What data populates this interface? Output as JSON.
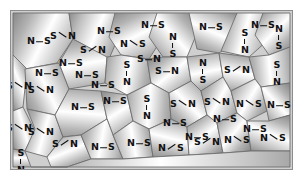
{
  "figure": {
    "kind": "microstructure-schematic",
    "border_color": "#8d8d8d",
    "background_color": "#cfcfcf",
    "grain_fill_light": "#ffffff",
    "grain_fill_dark": "#8a8a8a",
    "grain_edge_color": "#6e6e6e",
    "label_color": "#111111",
    "atom_labels": [
      "N",
      "S"
    ],
    "grain_count": 44,
    "label_count": 44
  },
  "grains": [
    {
      "id": 1,
      "points": "2,2 58,2 62,28 46,52 14,58 2,44",
      "angle": 25
    },
    {
      "id": 2,
      "points": "58,2 104,2 110,20 98,48 62,28",
      "angle": 200
    },
    {
      "id": 3,
      "points": "104,2 146,2 152,26 138,48 110,44 98,26",
      "angle": 60
    },
    {
      "id": 4,
      "points": "146,2 178,2 186,22 176,46 152,46 138,26",
      "angle": 140
    },
    {
      "id": 5,
      "points": "178,2 226,2 230,26 208,42 186,38",
      "angle": 300
    },
    {
      "id": 6,
      "points": "226,2 252,2 256,30 238,46 210,40",
      "angle": 15
    },
    {
      "id": 7,
      "points": "252,2 279,2 279,36 258,44 244,24",
      "angle": 230
    },
    {
      "id": 8,
      "points": "2,44 16,58 12,96 2,100",
      "angle": 120
    },
    {
      "id": 9,
      "points": "14,58 48,52 58,78 44,104 16,98",
      "angle": 330
    },
    {
      "id": 10,
      "points": "48,52 62,28 96,46 94,72 58,78",
      "angle": 80
    },
    {
      "id": 11,
      "points": "96,46 110,44 136,48 140,72 116,84 94,72",
      "angle": 190
    },
    {
      "id": 12,
      "points": "136,48 152,46 176,46 180,70 158,82 140,72",
      "angle": 45
    },
    {
      "id": 13,
      "points": "176,46 208,42 212,66 190,80 180,70",
      "angle": 260
    },
    {
      "id": 14,
      "points": "208,42 238,46 244,68 220,80 212,66",
      "angle": 100
    },
    {
      "id": 15,
      "points": "238,46 258,44 279,36 279,72 250,76 244,68",
      "angle": 355
    },
    {
      "id": 16,
      "points": "2,100 12,96 24,120 14,140 2,138",
      "angle": 150
    },
    {
      "id": 17,
      "points": "16,98 44,104 52,126 36,146 14,140 24,118",
      "angle": 20
    },
    {
      "id": 18,
      "points": "44,104 58,78 90,80 96,108 70,124 52,126",
      "angle": 275
    },
    {
      "id": 19,
      "points": "90,80 116,84 122,110 102,124 96,108",
      "angle": 65
    },
    {
      "id": 20,
      "points": "116,84 140,72 158,82 160,108 138,118 122,110",
      "angle": 185
    },
    {
      "id": 21,
      "points": "158,82 180,70 190,80 196,104 176,116 160,108",
      "angle": 310
    },
    {
      "id": 22,
      "points": "190,80 212,66 220,80 226,102 206,112 196,104",
      "angle": 35
    },
    {
      "id": 23,
      "points": "220,80 244,68 250,76 256,100 236,110 226,102",
      "angle": 215
    },
    {
      "id": 24,
      "points": "250,76 279,72 279,104 258,110 256,100",
      "angle": 130
    },
    {
      "id": 25,
      "points": "2,138 14,140 20,156 2,156",
      "angle": 90
    },
    {
      "id": 26,
      "points": "36,146 52,126 70,124 80,148 56,156 40,156",
      "angle": 240
    },
    {
      "id": 27,
      "points": "70,124 96,108 102,124 112,148 80,148",
      "angle": 10
    },
    {
      "id": 28,
      "points": "102,124 122,110 138,118 142,146 112,148",
      "angle": 170
    },
    {
      "id": 29,
      "points": "138,118 160,108 176,116 178,144 142,146",
      "angle": 285
    },
    {
      "id": 30,
      "points": "176,116 196,104 206,112 212,142 178,144",
      "angle": 55
    },
    {
      "id": 31,
      "points": "206,112 226,102 236,110 240,140 212,142",
      "angle": 225
    },
    {
      "id": 32,
      "points": "236,110 258,110 279,104 279,140 240,140",
      "angle": 115
    },
    {
      "id": 33,
      "points": "20,156 40,156 56,156 80,148 112,148 142,146 178,144 212,142 240,140 279,140 279,156",
      "angle": 0
    }
  ],
  "labels": [
    {
      "id": 1,
      "x": 28,
      "y": 30,
      "form": "h",
      "a": "N",
      "b": "S"
    },
    {
      "id": 2,
      "x": 82,
      "y": 38,
      "form": "dne",
      "a": "S",
      "b": "N"
    },
    {
      "id": 3,
      "x": 122,
      "y": 32,
      "form": "dsw",
      "a": "N",
      "b": "S"
    },
    {
      "id": 4,
      "x": 162,
      "y": 34,
      "form": "v",
      "a": "N",
      "b": "S"
    },
    {
      "id": 5,
      "x": 200,
      "y": 16,
      "form": "h",
      "a": "N",
      "b": "S"
    },
    {
      "id": 6,
      "x": 234,
      "y": 30,
      "form": "v",
      "a": "S",
      "b": "N"
    },
    {
      "id": 7,
      "x": 268,
      "y": 26,
      "form": "v",
      "a": "N",
      "b": "S"
    },
    {
      "id": 8,
      "x": 8,
      "y": 74,
      "form": "dsw",
      "a": "S",
      "b": "N"
    },
    {
      "id": 9,
      "x": 30,
      "y": 78,
      "form": "dsw",
      "a": "S",
      "b": "N"
    },
    {
      "id": 10,
      "x": 76,
      "y": 64,
      "form": "h",
      "a": "N",
      "b": "S"
    },
    {
      "id": 11,
      "x": 116,
      "y": 62,
      "form": "v",
      "a": "S",
      "b": "N"
    },
    {
      "id": 12,
      "x": 156,
      "y": 60,
      "form": "h",
      "a": "S",
      "b": "N"
    },
    {
      "id": 13,
      "x": 192,
      "y": 60,
      "form": "v",
      "a": "N",
      "b": "S"
    },
    {
      "id": 14,
      "x": 226,
      "y": 58,
      "form": "dne",
      "a": "S",
      "b": "N"
    },
    {
      "id": 15,
      "x": 266,
      "y": 62,
      "form": "v",
      "a": "S",
      "b": "N"
    },
    {
      "id": 16,
      "x": 8,
      "y": 116,
      "form": "dsw",
      "a": "S",
      "b": "N"
    },
    {
      "id": 17,
      "x": 30,
      "y": 120,
      "form": "dsw",
      "a": "S",
      "b": "N"
    },
    {
      "id": 18,
      "x": 72,
      "y": 96,
      "form": "h",
      "a": "N",
      "b": "S"
    },
    {
      "id": 19,
      "x": 104,
      "y": 90,
      "form": "h",
      "a": "N",
      "b": "S"
    },
    {
      "id": 20,
      "x": 136,
      "y": 96,
      "form": "v",
      "a": "S",
      "b": "N"
    },
    {
      "id": 21,
      "x": 172,
      "y": 92,
      "form": "dse",
      "a": "S",
      "b": "N"
    },
    {
      "id": 22,
      "x": 206,
      "y": 90,
      "form": "dse",
      "a": "S",
      "b": "N"
    },
    {
      "id": 23,
      "x": 238,
      "y": 92,
      "form": "dsw",
      "a": "N",
      "b": "S"
    },
    {
      "id": 24,
      "x": 268,
      "y": 94,
      "form": "h",
      "a": "N",
      "b": "S"
    },
    {
      "id": 25,
      "x": 10,
      "y": 150,
      "form": "v",
      "a": "S",
      "b": "N"
    },
    {
      "id": 26,
      "x": 54,
      "y": 132,
      "form": "dne",
      "a": "S",
      "b": "N"
    },
    {
      "id": 27,
      "x": 92,
      "y": 136,
      "form": "h",
      "a": "N",
      "b": "S"
    },
    {
      "id": 28,
      "x": 128,
      "y": 132,
      "form": "h",
      "a": "N",
      "b": "S"
    },
    {
      "id": 29,
      "x": 160,
      "y": 136,
      "form": "dne",
      "a": "N",
      "b": "S"
    },
    {
      "id": 30,
      "x": 196,
      "y": 130,
      "form": "dne",
      "a": "S",
      "b": "N"
    },
    {
      "id": 31,
      "x": 226,
      "y": 128,
      "form": "dsw",
      "a": "N",
      "b": "S"
    },
    {
      "id": 32,
      "x": 262,
      "y": 126,
      "form": "dsw",
      "a": "N",
      "b": "S"
    },
    {
      "id": 33,
      "x": 52,
      "y": 24,
      "form": "dsw",
      "a": "S",
      "b": "N"
    },
    {
      "id": 34,
      "x": 98,
      "y": 20,
      "form": "h",
      "a": "N",
      "b": "S"
    },
    {
      "id": 35,
      "x": 142,
      "y": 14,
      "form": "h",
      "a": "N",
      "b": "S"
    },
    {
      "id": 36,
      "x": 252,
      "y": 14,
      "form": "h",
      "a": "N",
      "b": "S"
    },
    {
      "id": 37,
      "x": 60,
      "y": 52,
      "form": "h",
      "a": "N",
      "b": "S"
    },
    {
      "id": 38,
      "x": 138,
      "y": 48,
      "form": "h",
      "a": "S",
      "b": "N"
    },
    {
      "id": 39,
      "x": 92,
      "y": 74,
      "form": "h",
      "a": "N",
      "b": "S"
    },
    {
      "id": 40,
      "x": 164,
      "y": 112,
      "form": "h",
      "a": "N",
      "b": "S"
    },
    {
      "id": 41,
      "x": 36,
      "y": 62,
      "form": "h",
      "a": "N",
      "b": "S"
    },
    {
      "id": 42,
      "x": 214,
      "y": 108,
      "form": "h",
      "a": "N",
      "b": "S"
    },
    {
      "id": 43,
      "x": 244,
      "y": 118,
      "form": "h",
      "a": "N",
      "b": "S"
    },
    {
      "id": 44,
      "x": 186,
      "y": 126,
      "form": "h",
      "a": "N",
      "b": "S"
    }
  ]
}
